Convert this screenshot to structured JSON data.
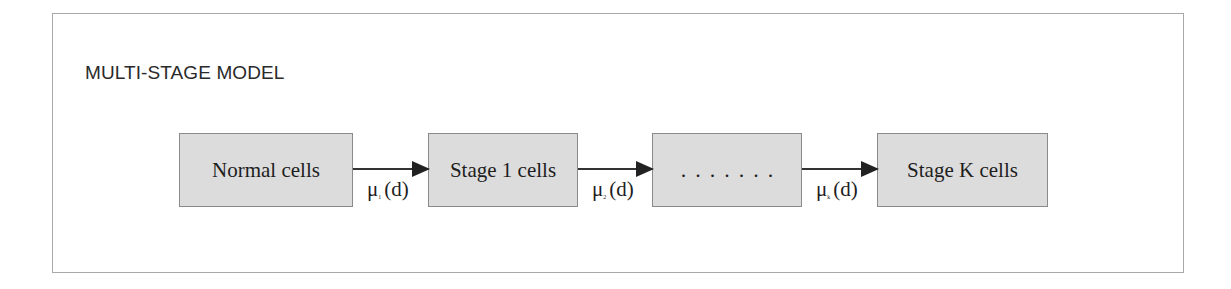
{
  "title": "MULTI-STAGE MODEL",
  "stages": [
    {
      "label": "Normal cells"
    },
    {
      "label": "Stage 1 cells"
    },
    {
      "label": ". . . . . . ."
    },
    {
      "label": "Stage K cells"
    }
  ],
  "transitions": [
    {
      "symbol": "μ",
      "subscript": "1",
      "arg": "(d)"
    },
    {
      "symbol": "μ",
      "subscript": "2",
      "arg": "(d)"
    },
    {
      "symbol": "μ",
      "subscript": "k",
      "arg": "(d)"
    }
  ],
  "colors": {
    "box_fill": "#dcdcdc",
    "box_border": "#8a8a8a",
    "arrow": "#222222",
    "frame": "#a8a8a8"
  }
}
